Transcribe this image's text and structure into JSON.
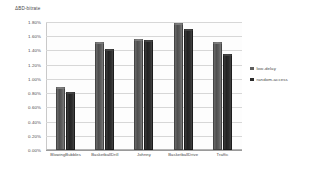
{
  "chart_data": {
    "type": "bar",
    "title": "",
    "subtitle": "",
    "xlabel": "",
    "ylabel": "ΔBD-bitrate",
    "categories": [
      "BlowingBubbles",
      "BasketballDrill",
      "Johnny",
      "BasketballDrive",
      "Traffic"
    ],
    "series": [
      {
        "name": "low-delay",
        "color": "#5e5e5e",
        "values": [
          0.88,
          1.52,
          1.56,
          1.79,
          1.52
        ]
      },
      {
        "name": "random-access",
        "color": "#2c2c2c",
        "values": [
          0.82,
          1.42,
          1.55,
          1.7,
          1.35
        ]
      }
    ],
    "ylim": [
      0.0,
      1.8
    ],
    "ytick_step": 0.2,
    "ytick_labels": [
      "1.80%",
      "1.60%",
      "1.40%",
      "1.20%",
      "1.00%",
      "0.80%",
      "0.60%",
      "0.40%",
      "0.20%",
      "0.00%"
    ],
    "ytick_values": [
      1.8,
      1.6,
      1.4,
      1.2,
      1.0,
      0.8,
      0.6,
      0.4,
      0.2,
      0.0
    ],
    "grid": true,
    "grid_axis": "y",
    "legend_position": "right",
    "value_format": "percent",
    "style": "3d-grouped-column-grayscale",
    "background_color": "#ffffff",
    "gridline_color": "#d7d7d7",
    "axis_color": "#9a9a9a"
  }
}
